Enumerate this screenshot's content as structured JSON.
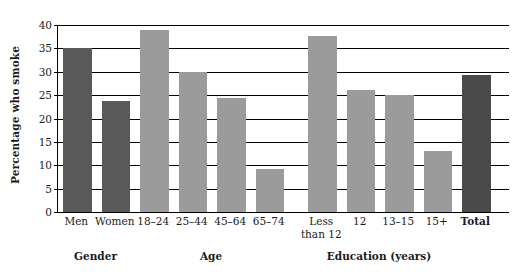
{
  "chart_data": {
    "type": "bar",
    "title": "",
    "xlabel": "",
    "ylabel": "Percentage who smoke",
    "ylim": [
      0,
      40
    ],
    "ytick_values": [
      0,
      5,
      10,
      15,
      20,
      25,
      30,
      35,
      40
    ],
    "ytick_labels": [
      "0",
      "5",
      "10",
      "15",
      "20",
      "25",
      "30",
      "35",
      "40"
    ],
    "grid": true,
    "legend": "none",
    "categories": [
      "Men",
      "Women",
      "18–24",
      "25–44",
      "45–64",
      "65–74",
      "Less than 12",
      "12",
      "13–15",
      "15+",
      "Total"
    ],
    "values": [
      35,
      23.8,
      39,
      30,
      24.3,
      9.3,
      37.6,
      26.2,
      25,
      13,
      29.3
    ],
    "bar_colors": [
      "#595959",
      "#595959",
      "#9b9b9b",
      "#9b9b9b",
      "#9b9b9b",
      "#9b9b9b",
      "#9b9b9b",
      "#9b9b9b",
      "#9b9b9b",
      "#9b9b9b",
      "#4a4a4a"
    ],
    "bars": [
      {
        "label": "Men",
        "label_line2": "",
        "value": 35,
        "color": "#595959",
        "group": "Gender",
        "bold": false
      },
      {
        "label": "Women",
        "label_line2": "",
        "value": 23.8,
        "color": "#595959",
        "group": "Gender",
        "bold": false
      },
      {
        "label": "18–24",
        "label_line2": "",
        "value": 39,
        "color": "#9b9b9b",
        "group": "Age",
        "bold": false
      },
      {
        "label": "25–44",
        "label_line2": "",
        "value": 30,
        "color": "#9b9b9b",
        "group": "Age",
        "bold": false
      },
      {
        "label": "45–64",
        "label_line2": "",
        "value": 24.3,
        "color": "#9b9b9b",
        "group": "Age",
        "bold": false
      },
      {
        "label": "65–74",
        "label_line2": "",
        "value": 9.3,
        "color": "#9b9b9b",
        "group": "Age",
        "bold": false
      },
      {
        "label": "Less",
        "label_line2": "than 12",
        "value": 37.6,
        "color": "#9b9b9b",
        "group": "Education (years)",
        "bold": false
      },
      {
        "label": "12",
        "label_line2": "",
        "value": 26.2,
        "color": "#9b9b9b",
        "group": "Education (years)",
        "bold": false
      },
      {
        "label": "13–15",
        "label_line2": "",
        "value": 25,
        "color": "#9b9b9b",
        "group": "Education (years)",
        "bold": false
      },
      {
        "label": "15+",
        "label_line2": "",
        "value": 13,
        "color": "#9b9b9b",
        "group": "Education (years)",
        "bold": false
      },
      {
        "label": "Total",
        "label_line2": "",
        "value": 29.3,
        "color": "#4a4a4a",
        "group": "",
        "bold": true
      }
    ],
    "groups": [
      {
        "label": "Gender"
      },
      {
        "label": "Age"
      },
      {
        "label": "Education (years)"
      }
    ]
  }
}
